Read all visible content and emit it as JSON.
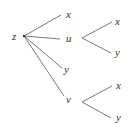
{
  "diagram": {
    "type": "tree",
    "root": {
      "label": "z"
    },
    "level1": [
      {
        "label": "x"
      },
      {
        "label": "u",
        "children": [
          {
            "label": "x"
          },
          {
            "label": "y"
          }
        ]
      },
      {
        "label": "y"
      },
      {
        "label": "v",
        "children": [
          {
            "label": "x"
          },
          {
            "label": "y"
          }
        ]
      }
    ],
    "colors": {
      "line": "#555555",
      "text": "#333333",
      "background": "#ffffff"
    }
  }
}
